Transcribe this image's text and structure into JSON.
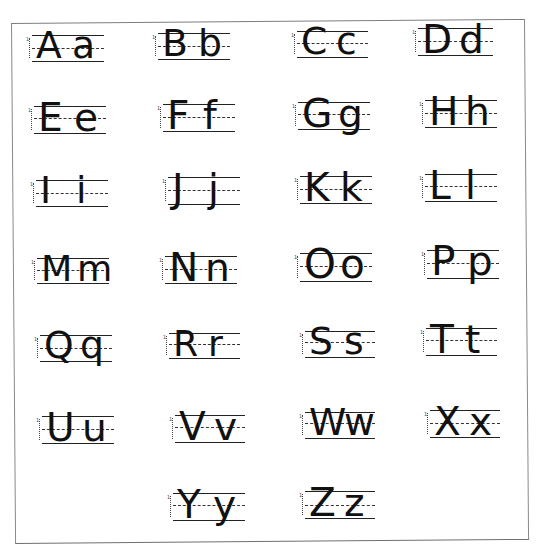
{
  "worksheet": {
    "type": "alphabet handwriting practice",
    "ink_color": "#111111",
    "line_color": "#222222",
    "border_color": "#7d7d7d",
    "background": "#ffffff",
    "cells": [
      {
        "upper": "A",
        "lower": "a",
        "x": 32,
        "top": 35,
        "mid": 48,
        "base": 61,
        "w": 72
      },
      {
        "upper": "B",
        "lower": "b",
        "x": 158,
        "top": 33,
        "mid": 46,
        "base": 59,
        "w": 72
      },
      {
        "upper": "C",
        "lower": "c",
        "x": 297,
        "top": 31,
        "mid": 43,
        "base": 57,
        "w": 71
      },
      {
        "upper": "D",
        "lower": "d",
        "x": 418,
        "top": 28,
        "mid": 41,
        "base": 55,
        "w": 75
      },
      {
        "upper": "E",
        "lower": "e",
        "x": 34,
        "top": 106,
        "mid": 118,
        "base": 133,
        "w": 72
      },
      {
        "upper": "F",
        "lower": "f",
        "x": 163,
        "top": 104,
        "mid": 117,
        "base": 131,
        "w": 72
      },
      {
        "upper": "G",
        "lower": "g",
        "x": 298,
        "top": 102,
        "mid": 114,
        "base": 129,
        "w": 72
      },
      {
        "upper": "H",
        "lower": "h",
        "x": 425,
        "top": 100,
        "mid": 113,
        "base": 127,
        "w": 72
      },
      {
        "upper": "I",
        "lower": "i",
        "x": 36,
        "top": 180,
        "mid": 193,
        "base": 206,
        "w": 72
      },
      {
        "upper": "J",
        "lower": "j",
        "x": 168,
        "top": 177,
        "mid": 190,
        "base": 204,
        "w": 72
      },
      {
        "upper": "K",
        "lower": "k",
        "x": 300,
        "top": 176,
        "mid": 189,
        "base": 203,
        "w": 72
      },
      {
        "upper": "L",
        "lower": "l",
        "x": 425,
        "top": 174,
        "mid": 186,
        "base": 201,
        "w": 72
      },
      {
        "upper": "M",
        "lower": "m",
        "x": 37,
        "top": 258,
        "mid": 270,
        "base": 283,
        "w": 72
      },
      {
        "upper": "N",
        "lower": "n",
        "x": 165,
        "top": 256,
        "mid": 269,
        "base": 283,
        "w": 72
      },
      {
        "upper": "O",
        "lower": "o",
        "x": 300,
        "top": 253,
        "mid": 266,
        "base": 281,
        "w": 72
      },
      {
        "upper": "P",
        "lower": "p",
        "x": 427,
        "top": 250,
        "mid": 263,
        "base": 278,
        "w": 72
      },
      {
        "upper": "Q",
        "lower": "q",
        "x": 40,
        "top": 335,
        "mid": 348,
        "base": 361,
        "w": 72
      },
      {
        "upper": "R",
        "lower": "r",
        "x": 169,
        "top": 333,
        "mid": 344,
        "base": 358,
        "w": 71
      },
      {
        "upper": "S",
        "lower": "s",
        "x": 305,
        "top": 331,
        "mid": 342,
        "base": 357,
        "w": 70
      },
      {
        "upper": "T",
        "lower": "t",
        "x": 426,
        "top": 328,
        "mid": 340,
        "base": 355,
        "w": 71
      },
      {
        "upper": "U",
        "lower": "u",
        "x": 42,
        "top": 416,
        "mid": 429,
        "base": 443,
        "w": 72
      },
      {
        "upper": "V",
        "lower": "v",
        "x": 175,
        "top": 415,
        "mid": 427,
        "base": 442,
        "w": 70
      },
      {
        "upper": "W",
        "lower": "w",
        "x": 305,
        "top": 412,
        "mid": 423,
        "base": 438,
        "w": 70
      },
      {
        "upper": "X",
        "lower": "x",
        "x": 430,
        "top": 410,
        "mid": 423,
        "base": 437,
        "w": 70
      },
      {
        "upper": "Y",
        "lower": "y",
        "x": 173,
        "top": 493,
        "mid": 505,
        "base": 520,
        "w": 72
      },
      {
        "upper": "Z",
        "lower": "z",
        "x": 305,
        "top": 491,
        "mid": 505,
        "base": 518,
        "w": 70
      }
    ]
  }
}
